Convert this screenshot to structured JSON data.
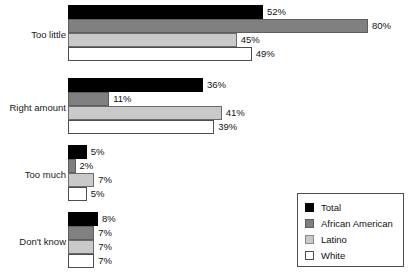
{
  "chart_data": {
    "type": "bar",
    "orientation": "horizontal",
    "title": "",
    "xlabel": "",
    "ylabel": "",
    "xlim": [
      0,
      80
    ],
    "grid": false,
    "value_suffix": "%",
    "legend_position": "bottom-right",
    "categories": [
      "Too little",
      "Right amount",
      "Too much",
      "Don't know"
    ],
    "series": [
      {
        "name": "Total",
        "color": "#000000",
        "values": [
          52,
          36,
          5,
          8
        ],
        "labels": [
          "52%",
          "36%",
          "5%",
          "8%"
        ]
      },
      {
        "name": "African American",
        "color": "#808080",
        "values": [
          80,
          11,
          2,
          7
        ],
        "labels": [
          "80%",
          "11%",
          "2%",
          "7%"
        ]
      },
      {
        "name": "Latino",
        "color": "#c9c9c9",
        "values": [
          45,
          41,
          7,
          7
        ],
        "labels": [
          "45%",
          "41%",
          "7%",
          "7%"
        ]
      },
      {
        "name": "White",
        "color": "#ffffff",
        "values": [
          49,
          39,
          5,
          7
        ],
        "labels": [
          "49%",
          "39%",
          "5%",
          "7%"
        ]
      }
    ]
  },
  "groups": [
    {
      "label": "Too little",
      "top": 5,
      "label_top": 29,
      "rows": [
        {
          "value": 52,
          "label": "52%",
          "series": 0
        },
        {
          "value": 80,
          "label": "80%",
          "series": 1
        },
        {
          "value": 45,
          "label": "45%",
          "series": 2
        },
        {
          "value": 49,
          "label": "49%",
          "series": 3
        }
      ]
    },
    {
      "label": "Right amount",
      "top": 78,
      "label_top": 102,
      "rows": [
        {
          "value": 36,
          "label": "36%",
          "series": 0
        },
        {
          "value": 11,
          "label": "11%",
          "series": 1
        },
        {
          "value": 41,
          "label": "41%",
          "series": 2
        },
        {
          "value": 39,
          "label": "39%",
          "series": 3
        }
      ]
    },
    {
      "label": "Too much",
      "top": 145,
      "label_top": 169,
      "rows": [
        {
          "value": 5,
          "label": "5%",
          "series": 0
        },
        {
          "value": 2,
          "label": "2%",
          "series": 1
        },
        {
          "value": 7,
          "label": "7%",
          "series": 2
        },
        {
          "value": 5,
          "label": "5%",
          "series": 3
        }
      ]
    },
    {
      "label": "Don't know",
      "top": 212,
      "label_top": 236,
      "rows": [
        {
          "value": 8,
          "label": "8%",
          "series": 0
        },
        {
          "value": 7,
          "label": "7%",
          "series": 1
        },
        {
          "value": 7,
          "label": "7%",
          "series": 2
        },
        {
          "value": 7,
          "label": "7%",
          "series": 3
        }
      ]
    }
  ],
  "legend": {
    "items": [
      {
        "label": "Total",
        "series": 0
      },
      {
        "label": "African American",
        "series": 1
      },
      {
        "label": "Latino",
        "series": 2
      },
      {
        "label": "White",
        "series": 3
      }
    ]
  },
  "scale": {
    "px_per_percent": 3.75,
    "origin_x": 68
  }
}
